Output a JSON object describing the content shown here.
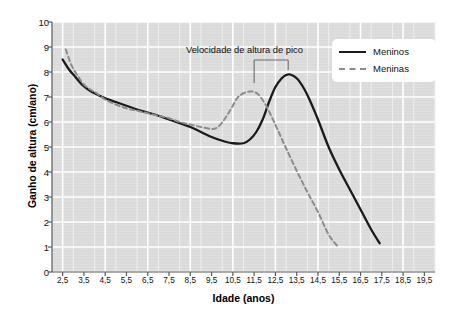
{
  "chart_data": {
    "type": "line",
    "title": "",
    "xlabel": "Idade (anos)",
    "ylabel": "Ganho de altura (cm/ano)",
    "xlim": [
      2.0,
      20.0
    ],
    "ylim": [
      0,
      10
    ],
    "xticks": [
      "2,5",
      "3,5",
      "4,5",
      "5,5",
      "6,5",
      "7,5",
      "8,5",
      "9,5",
      "10,5",
      "11,5",
      "12,5",
      "13,5",
      "14,5",
      "15,5",
      "16,5",
      "17,5",
      "18,5",
      "19,5"
    ],
    "xtick_values": [
      2.5,
      3.5,
      4.5,
      5.5,
      6.5,
      7.5,
      8.5,
      9.5,
      10.5,
      11.5,
      12.5,
      13.5,
      14.5,
      15.5,
      16.5,
      17.5,
      18.5,
      19.5
    ],
    "yticks": [
      "0",
      "1",
      "2",
      "3",
      "4",
      "5",
      "6",
      "7",
      "8",
      "9",
      "10"
    ],
    "ytick_values": [
      0,
      1,
      2,
      3,
      4,
      5,
      6,
      7,
      8,
      9,
      10
    ],
    "grid": true,
    "legend_position": "top-right",
    "series": [
      {
        "name": "Meninos",
        "style": "solid",
        "color": "#1a1a1a",
        "x": [
          2.5,
          2.8,
          3.1,
          3.4,
          3.7,
          4.0,
          4.5,
          5.0,
          5.5,
          6.0,
          6.5,
          7.0,
          7.5,
          8.0,
          8.5,
          9.0,
          9.5,
          10.0,
          10.5,
          11.0,
          11.3,
          11.6,
          11.9,
          12.2,
          12.5,
          12.8,
          13.0,
          13.2,
          13.5,
          13.8,
          14.1,
          14.5,
          15.0,
          15.5,
          16.0,
          16.5,
          17.0,
          17.4
        ],
        "y": [
          8.5,
          8.1,
          7.8,
          7.5,
          7.3,
          7.15,
          6.95,
          6.8,
          6.65,
          6.5,
          6.38,
          6.25,
          6.1,
          5.95,
          5.8,
          5.6,
          5.4,
          5.25,
          5.15,
          5.15,
          5.3,
          5.6,
          6.1,
          6.8,
          7.4,
          7.75,
          7.88,
          7.9,
          7.75,
          7.4,
          6.9,
          6.1,
          5.0,
          4.1,
          3.3,
          2.5,
          1.7,
          1.15
        ]
      },
      {
        "name": "Meninas",
        "style": "dashed",
        "color": "#8c8c8c",
        "x": [
          2.65,
          2.9,
          3.2,
          3.5,
          3.8,
          4.1,
          4.5,
          5.0,
          5.5,
          6.0,
          6.5,
          7.0,
          7.5,
          8.0,
          8.5,
          9.0,
          9.5,
          9.8,
          10.1,
          10.4,
          10.7,
          11.0,
          11.3,
          11.5,
          11.7,
          12.0,
          12.3,
          12.6,
          13.0,
          13.5,
          14.0,
          14.5,
          15.0,
          15.4
        ],
        "y": [
          8.9,
          8.3,
          7.85,
          7.5,
          7.3,
          7.15,
          6.9,
          6.7,
          6.55,
          6.45,
          6.35,
          6.25,
          6.15,
          6.0,
          5.9,
          5.8,
          5.72,
          5.8,
          6.1,
          6.5,
          6.95,
          7.15,
          7.22,
          7.2,
          7.1,
          6.75,
          6.25,
          5.7,
          4.95,
          4.05,
          3.2,
          2.4,
          1.5,
          1.05
        ]
      }
    ],
    "annotations": [
      {
        "text": "Velocidade de altura de pico",
        "bracket_x_start": 11.5,
        "bracket_x_end": 13.1
      }
    ]
  }
}
